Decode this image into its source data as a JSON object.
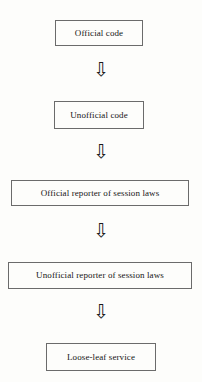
{
  "diagram": {
    "type": "vertical-flowchart",
    "orientation": "top-to-bottom",
    "background_color": "#fdfdfb",
    "border_color": "#6b6b6b",
    "text_color": "#151515",
    "nodes": [
      {
        "id": "node-1",
        "label": "Official code"
      },
      {
        "id": "node-2",
        "label": "Unofficial code"
      },
      {
        "id": "node-3",
        "label": "Official reporter of session laws"
      },
      {
        "id": "node-4",
        "label": "Unofficial reporter of session laws"
      },
      {
        "id": "node-5",
        "label": "Loose-leaf service"
      }
    ],
    "connectors": [
      {
        "id": "arrow-1",
        "glyph": "⇩",
        "from": "node-1",
        "to": "node-2"
      },
      {
        "id": "arrow-2",
        "glyph": "⇩",
        "from": "node-2",
        "to": "node-3"
      },
      {
        "id": "arrow-3",
        "glyph": "⇩",
        "from": "node-3",
        "to": "node-4"
      },
      {
        "id": "arrow-4",
        "glyph": "⇩",
        "from": "node-4",
        "to": "node-5"
      }
    ]
  }
}
